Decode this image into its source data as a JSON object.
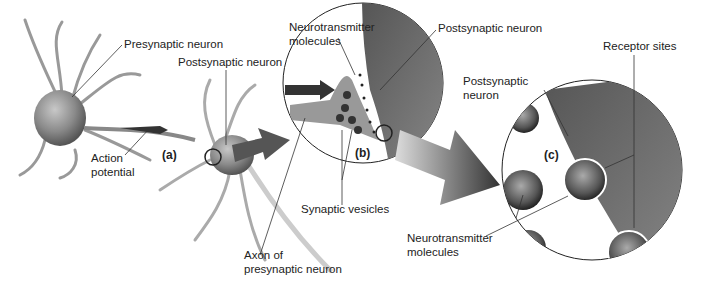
{
  "labels": {
    "presynaptic_neuron": "Presynaptic neuron",
    "postsynaptic_neuron_a": "Postsynaptic neuron",
    "action_potential_1": "Action",
    "action_potential_2": "potential",
    "axon_1": "Axon of",
    "axon_2": "presynaptic neuron",
    "nt_molecules_b_1": "Neurotransmitter",
    "nt_molecules_b_2": "molecules",
    "postsynaptic_neuron_b": "Postsynaptic neuron",
    "synaptic_vesicles": "Synaptic vesicles",
    "postsynaptic_neuron_c_1": "Postsynaptic",
    "postsynaptic_neuron_c_2": "neuron",
    "receptor_sites": "Receptor sites",
    "nt_molecules_c_1": "Neurotransmitter",
    "nt_molecules_c_2": "molecules"
  },
  "panels": {
    "a": "(a)",
    "b": "(b)",
    "c": "(c)"
  }
}
